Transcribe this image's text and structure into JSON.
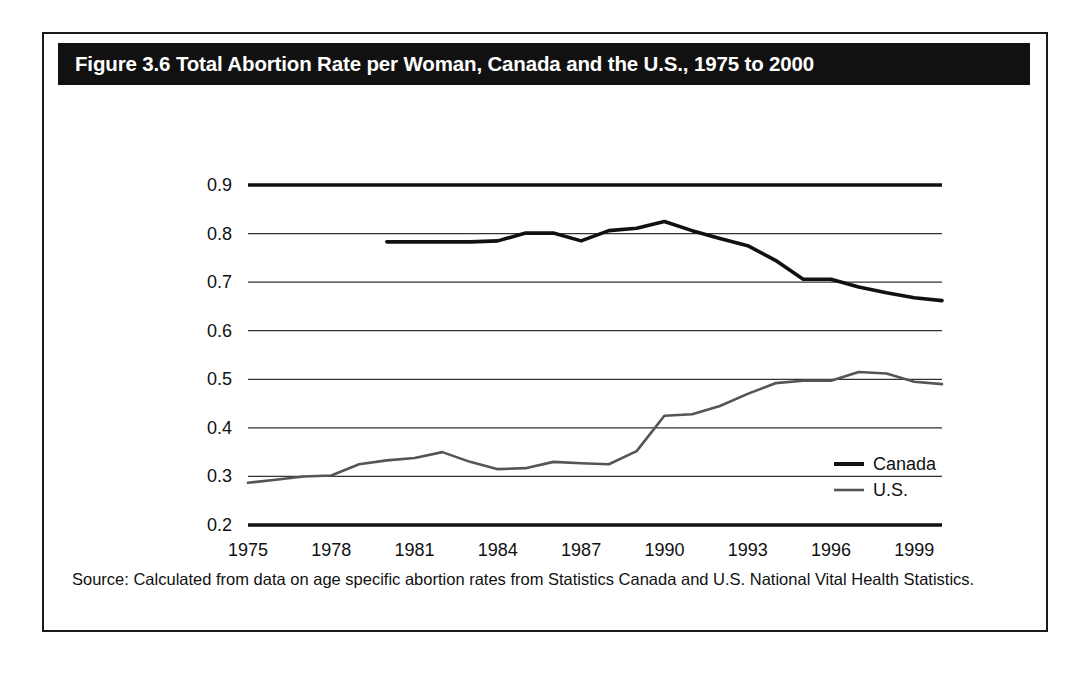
{
  "figure": {
    "title": "Figure 3.6 Total Abortion Rate per Woman, Canada and the U.S., 1975 to 2000",
    "source_note": "Source: Calculated from data on age specific abortion rates from Statistics Canada and U.S. National Vital Health Statistics."
  },
  "colors": {
    "title_bar_bg": "#111111",
    "title_text": "#ffffff",
    "frame_border": "#1a1a1a",
    "canada_line": "#111111",
    "us_line": "#555555",
    "gridline": "#333333",
    "axis_line": "#111111"
  },
  "chart_data": {
    "type": "line",
    "title": "Figure 3.6 Total Abortion Rate per Woman, Canada and the U.S., 1975 to 2000",
    "xlabel": "",
    "ylabel": "",
    "xlim": [
      1975,
      2000
    ],
    "ylim": [
      0.2,
      0.9
    ],
    "grid": true,
    "legend_position": "right-inside",
    "x_tick_labels": [
      "1975",
      "1978",
      "1981",
      "1984",
      "1987",
      "1990",
      "1993",
      "1996",
      "1999"
    ],
    "x_tick_values": [
      1975,
      1978,
      1981,
      1984,
      1987,
      1990,
      1993,
      1996,
      1999
    ],
    "y_tick_labels": [
      "0.9",
      "0.8",
      "0.7",
      "0.6",
      "0.5",
      "0.4",
      "0.3",
      "0.2"
    ],
    "y_tick_values": [
      0.9,
      0.8,
      0.7,
      0.6,
      0.5,
      0.4,
      0.3,
      0.2
    ],
    "series": [
      {
        "name": "Canada",
        "color": "#111111",
        "width": 3.6,
        "x": [
          1980,
          1981,
          1982,
          1983,
          1984,
          1985,
          1986,
          1987,
          1988,
          1989,
          1990,
          1991,
          1992,
          1993,
          1994,
          1995,
          1996,
          1997,
          1998,
          1999,
          2000
        ],
        "values": [
          0.783,
          0.783,
          0.783,
          0.783,
          0.785,
          0.801,
          0.801,
          0.785,
          0.806,
          0.811,
          0.825,
          0.806,
          0.79,
          0.775,
          0.745,
          0.706,
          0.706,
          0.69,
          0.678,
          0.668,
          0.662
        ]
      },
      {
        "name": "U.S.",
        "color": "#555555",
        "width": 2.6,
        "x": [
          1975,
          1976,
          1977,
          1978,
          1979,
          1980,
          1981,
          1982,
          1983,
          1984,
          1985,
          1986,
          1987,
          1988,
          1989,
          1990,
          1991,
          1992,
          1993,
          1994,
          1995,
          1996,
          1997,
          1998,
          1999,
          2000
        ],
        "values": [
          0.287,
          0.293,
          0.3,
          0.302,
          0.325,
          0.333,
          0.338,
          0.35,
          0.33,
          0.315,
          0.317,
          0.33,
          0.327,
          0.325,
          0.352,
          0.425,
          0.428,
          0.445,
          0.47,
          0.492,
          0.497,
          0.497,
          0.515,
          0.512,
          0.495,
          0.49
        ]
      }
    ]
  },
  "legend": {
    "items": [
      {
        "label": "Canada",
        "color": "#111111",
        "width": 4
      },
      {
        "label": "U.S.",
        "color": "#555555",
        "width": 2.6
      }
    ]
  }
}
